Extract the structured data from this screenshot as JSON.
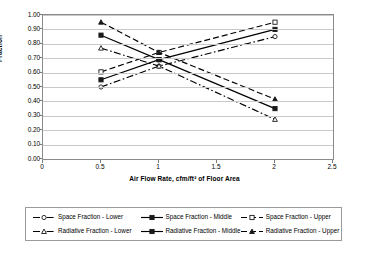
{
  "chart_data": {
    "type": "line",
    "title": "",
    "xlabel": "Air Flow Rate, cfm/ft² of Floor Area",
    "ylabel": "Fraction",
    "xlim": [
      0,
      2.5
    ],
    "ylim": [
      0,
      1.0
    ],
    "xticks": [
      "0",
      "0.5",
      "1",
      "1.5",
      "2",
      "2.5"
    ],
    "xtick_values": [
      0,
      0.5,
      1,
      1.5,
      2,
      2.5
    ],
    "yticks": [
      "0.00",
      "0.10",
      "0.20",
      "0.30",
      "0.40",
      "0.50",
      "0.60",
      "0.70",
      "0.80",
      "0.90",
      "1.00"
    ],
    "ytick_values": [
      0,
      0.1,
      0.2,
      0.3,
      0.4,
      0.5,
      0.6,
      0.7,
      0.8,
      0.9,
      1.0
    ],
    "grid": "horizontal",
    "legend_position": "below",
    "x": [
      0.5,
      1,
      2
    ],
    "series": [
      {
        "name": "Space Fraction - Lower",
        "values": [
          0.5,
          0.645,
          0.85
        ],
        "dash": "dashdot",
        "marker": "open-circle",
        "color": "#000000"
      },
      {
        "name": "Space Fraction - Middle",
        "values": [
          0.55,
          0.69,
          0.9
        ],
        "dash": "solid",
        "marker": "filled-square",
        "color": "#000000"
      },
      {
        "name": "Space Fraction - Upper",
        "values": [
          0.605,
          0.74,
          0.95
        ],
        "dash": "dashed",
        "marker": "open-square",
        "color": "#000000"
      },
      {
        "name": "Radiative Fraction - Lower",
        "values": [
          0.77,
          0.645,
          0.275
        ],
        "dash": "dashdot",
        "marker": "open-triangle",
        "color": "#000000"
      },
      {
        "name": "Radiative Fraction - Middle",
        "values": [
          0.86,
          0.69,
          0.35
        ],
        "dash": "solid",
        "marker": "filled-square",
        "color": "#000000"
      },
      {
        "name": "Radiative Fraction - Upper",
        "values": [
          0.95,
          0.74,
          0.415
        ],
        "dash": "dashed",
        "marker": "filled-triangle",
        "color": "#000000"
      }
    ]
  },
  "legend": {
    "rows": [
      [
        "Space Fraction - Lower",
        "Space Fraction - Middle",
        "Space Fraction - Upper"
      ],
      [
        "Radiative Fraction - Lower",
        "Radiative Fraction - Middle",
        "Radiative Fraction - Upper"
      ]
    ]
  }
}
